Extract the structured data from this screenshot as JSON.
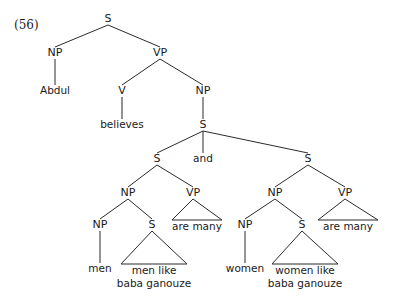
{
  "figure": {
    "example_number": "(56)",
    "kind": "syntax-tree",
    "colors": {
      "background": "#ffffff",
      "line": "#2b2b2b",
      "text": "#1a1a1a"
    }
  },
  "tree": {
    "nodes": [
      {
        "id": "s-root",
        "label": "S",
        "x": 108,
        "y": 22,
        "type": "nonterminal"
      },
      {
        "id": "np-subj",
        "label": "NP",
        "x": 55,
        "y": 56,
        "type": "nonterminal"
      },
      {
        "id": "vp-main",
        "label": "VP",
        "x": 160,
        "y": 56,
        "type": "nonterminal"
      },
      {
        "id": "abdul",
        "label": "Abdul",
        "x": 55,
        "y": 94,
        "type": "terminal"
      },
      {
        "id": "v-believes",
        "label": "V",
        "x": 122,
        "y": 94,
        "type": "nonterminal"
      },
      {
        "id": "np-comp",
        "label": "NP",
        "x": 203,
        "y": 94,
        "type": "nonterminal"
      },
      {
        "id": "believes",
        "label": "believes",
        "x": 122,
        "y": 128,
        "type": "terminal"
      },
      {
        "id": "s-coord",
        "label": "S",
        "x": 203,
        "y": 128,
        "type": "nonterminal"
      },
      {
        "id": "s-left",
        "label": "S",
        "x": 157,
        "y": 162,
        "type": "nonterminal"
      },
      {
        "id": "and",
        "label": "and",
        "x": 203,
        "y": 162,
        "type": "terminal"
      },
      {
        "id": "s-right",
        "label": "S",
        "x": 308,
        "y": 162,
        "type": "nonterminal"
      },
      {
        "id": "np-left",
        "label": "NP",
        "x": 128,
        "y": 196,
        "type": "nonterminal"
      },
      {
        "id": "vp-left",
        "label": "VP",
        "x": 193,
        "y": 196,
        "type": "nonterminal"
      },
      {
        "id": "np-right",
        "label": "NP",
        "x": 275,
        "y": 196,
        "type": "nonterminal"
      },
      {
        "id": "vp-right",
        "label": "VP",
        "x": 345,
        "y": 196,
        "type": "nonterminal"
      },
      {
        "id": "np-men",
        "label": "NP",
        "x": 100,
        "y": 228,
        "type": "nonterminal"
      },
      {
        "id": "s-men-rel",
        "label": "S",
        "x": 152,
        "y": 228,
        "type": "nonterminal"
      },
      {
        "id": "np-women",
        "label": "NP",
        "x": 245,
        "y": 228,
        "type": "nonterminal"
      },
      {
        "id": "s-women-rel",
        "label": "S",
        "x": 302,
        "y": 228,
        "type": "nonterminal"
      },
      {
        "id": "men",
        "label": "men",
        "x": 100,
        "y": 272,
        "type": "terminal"
      },
      {
        "id": "women",
        "label": "women",
        "x": 245,
        "y": 272,
        "type": "terminal"
      }
    ],
    "branches": [
      {
        "from": "s-root",
        "to": "np-subj"
      },
      {
        "from": "s-root",
        "to": "vp-main"
      },
      {
        "from": "np-subj",
        "to": "abdul"
      },
      {
        "from": "vp-main",
        "to": "v-believes"
      },
      {
        "from": "vp-main",
        "to": "np-comp"
      },
      {
        "from": "v-believes",
        "to": "believes"
      },
      {
        "from": "np-comp",
        "to": "s-coord"
      },
      {
        "from": "s-coord",
        "to": "s-left"
      },
      {
        "from": "s-coord",
        "to": "and"
      },
      {
        "from": "s-coord",
        "to": "s-right"
      },
      {
        "from": "s-left",
        "to": "np-left"
      },
      {
        "from": "s-left",
        "to": "vp-left"
      },
      {
        "from": "s-right",
        "to": "np-right"
      },
      {
        "from": "s-right",
        "to": "vp-right"
      },
      {
        "from": "np-left",
        "to": "np-men"
      },
      {
        "from": "np-left",
        "to": "s-men-rel"
      },
      {
        "from": "np-right",
        "to": "np-women"
      },
      {
        "from": "np-right",
        "to": "s-women-rel"
      },
      {
        "from": "np-men",
        "to": "men"
      },
      {
        "from": "np-women",
        "to": "women"
      }
    ],
    "triangles": [
      {
        "id": "tri-vp-left",
        "parent": "vp-left",
        "left_x": 172,
        "right_x": 222,
        "base_y": 220,
        "lines": [
          "are many"
        ],
        "text_x": 197,
        "text_y": 230
      },
      {
        "id": "tri-vp-right",
        "parent": "vp-right",
        "left_x": 318,
        "right_x": 378,
        "base_y": 220,
        "lines": [
          "are many"
        ],
        "text_x": 348,
        "text_y": 230
      },
      {
        "id": "tri-s-men-rel",
        "parent": "s-men-rel",
        "left_x": 121,
        "right_x": 187,
        "base_y": 264,
        "lines": [
          "men like",
          "baba ganouze"
        ],
        "text_x": 154,
        "text_y": 274
      },
      {
        "id": "tri-s-women-rel",
        "parent": "s-women-rel",
        "left_x": 272,
        "right_x": 338,
        "base_y": 264,
        "lines": [
          "women like",
          "baba ganouze"
        ],
        "text_x": 305,
        "text_y": 274
      }
    ]
  }
}
